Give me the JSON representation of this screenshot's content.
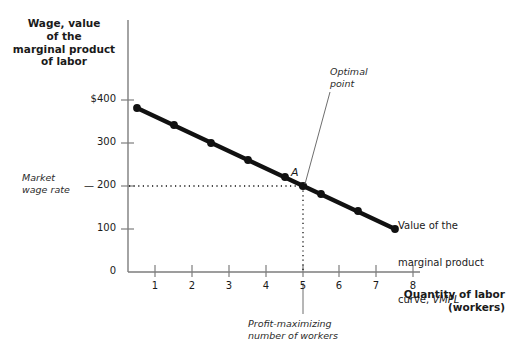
{
  "figure": {
    "background_color": "#ffffff",
    "ink_color": "#1a1a1a"
  },
  "axes": {
    "y_title": "Wage, value\nof the\nmarginal product\nof labor",
    "x_title": "Quantity of labor\n(workers)",
    "y_ticks": [
      "$400",
      "300",
      "200",
      "100",
      "0"
    ],
    "x_ticks": [
      "1",
      "2",
      "3",
      "4",
      "5",
      "6",
      "7",
      "8"
    ]
  },
  "annotations": {
    "market_wage": "Market\nwage rate",
    "market_wage_dash": "—",
    "optimal_point": "Optimal\npoint",
    "point_a": "A",
    "curve_label": "Value of the\nmarginal product\ncurve, VMPL",
    "curve_label_line1": "Value of the",
    "curve_label_line2": "marginal product",
    "curve_label_line3_pre": "curve, ",
    "curve_label_line3_em": "VMPL",
    "profit_max": "Profit-maximizing\nnumber of workers"
  },
  "chart_data": {
    "type": "line",
    "title": "",
    "xlabel": "Quantity of labor (workers)",
    "ylabel": "Wage, value of the marginal product of labor",
    "xlim": [
      0,
      8.2
    ],
    "ylim": [
      0,
      420
    ],
    "grid": false,
    "legend_position": "inline-right",
    "series": [
      {
        "name": "VMPL",
        "marker": "filled-circle",
        "color": "#111111",
        "x": [
          0.5,
          1.5,
          2.5,
          3.5,
          4.5,
          5.5,
          6.5,
          7.5
        ],
        "values": [
          380,
          340,
          300,
          260,
          220,
          180,
          140,
          100
        ]
      }
    ],
    "reference_lines": [
      {
        "name": "market-wage-rate",
        "orientation": "horizontal",
        "value": 200,
        "style": "dotted",
        "from_x": 0,
        "to_x": 5
      },
      {
        "name": "profit-maximizing-quantity",
        "orientation": "vertical",
        "value": 5,
        "style": "dotted",
        "from_y": 0,
        "to_y": 200
      }
    ],
    "annotated_points": [
      {
        "label": "A",
        "description": "Optimal point",
        "x": 5,
        "y": 200
      }
    ]
  }
}
